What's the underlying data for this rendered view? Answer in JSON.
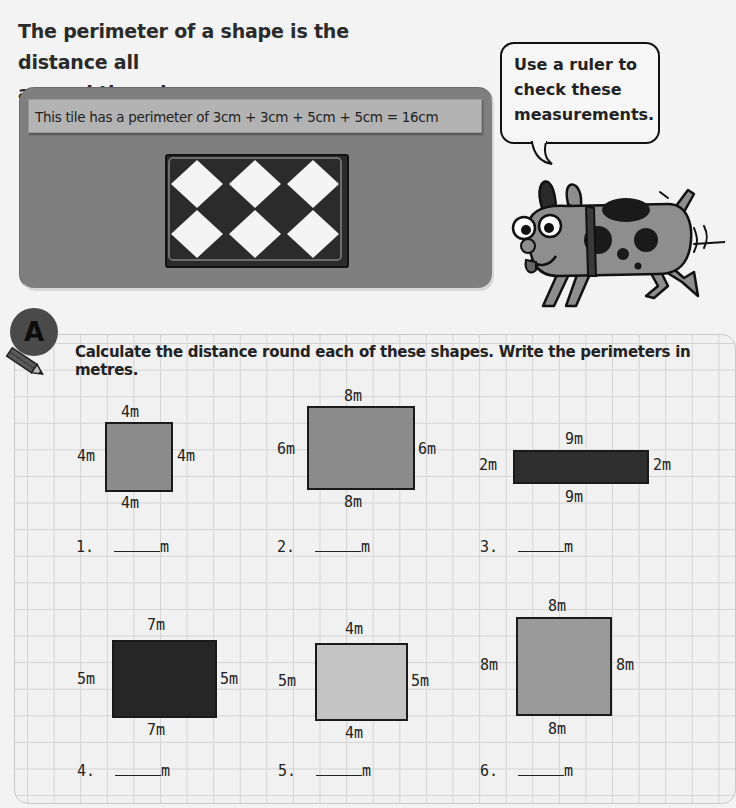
{
  "intro": {
    "line1": "The perimeter of a shape is the distance all",
    "line2": "around the edge."
  },
  "tile_panel": {
    "caption": "This tile has a perimeter of 3cm + 3cm + 5cm + 5cm = 16cm"
  },
  "speech_bubble": {
    "line1": "Use a ruler to",
    "line2": "check these",
    "line3": "measurements."
  },
  "section": {
    "badge": "A",
    "instruction": "Calculate the distance round each of these shapes. Write the perimeters in metres."
  },
  "unit": "m",
  "colors": {
    "panel": "#7f7f7f",
    "shape_light": "#c4c4c4",
    "shape_mid": "#8c8c8c",
    "shape_dark": "#2e2e2e"
  },
  "problems": [
    {
      "number": "1.",
      "top": "4m",
      "bottom": "4m",
      "left": "4m",
      "right": "4m",
      "answer": ""
    },
    {
      "number": "2.",
      "top": "8m",
      "bottom": "8m",
      "left": "6m",
      "right": "6m",
      "answer": ""
    },
    {
      "number": "3.",
      "top": "9m",
      "bottom": "9m",
      "left": "2m",
      "right": "2m",
      "answer": ""
    },
    {
      "number": "4.",
      "top": "7m",
      "bottom": "7m",
      "left": "5m",
      "right": "5m",
      "answer": ""
    },
    {
      "number": "5.",
      "top": "4m",
      "bottom": "4m",
      "left": "5m",
      "right": "5m",
      "answer": ""
    },
    {
      "number": "6.",
      "top": "8m",
      "bottom": "8m",
      "left": "8m",
      "right": "8m",
      "answer": ""
    }
  ]
}
